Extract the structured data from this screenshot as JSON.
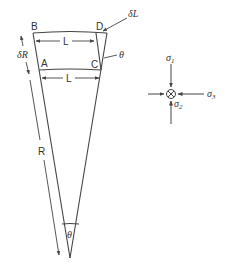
{
  "diagram": {
    "type": "geometry-sector-with-stress-state",
    "sector": {
      "corner_labels": {
        "B": "B",
        "D": "D",
        "A": "A",
        "C": "C"
      },
      "top_length_label": "L",
      "inner_length_label": "L",
      "delta_L_label": "δL",
      "theta_side_label": "θ",
      "delta_R_label": "δR",
      "radius_label": "R",
      "apex_angle_label": "θ"
    },
    "stress_state": {
      "sigma1_label": "σ",
      "sigma1_sub": "1",
      "sigma2_label": "σ",
      "sigma2_sub": "2",
      "sigma3_label": "σ",
      "sigma3_sub": "3",
      "center_symbol": "⊗"
    },
    "colors": {
      "line": "#444444",
      "text": "#333333",
      "background": "#ffffff"
    }
  }
}
